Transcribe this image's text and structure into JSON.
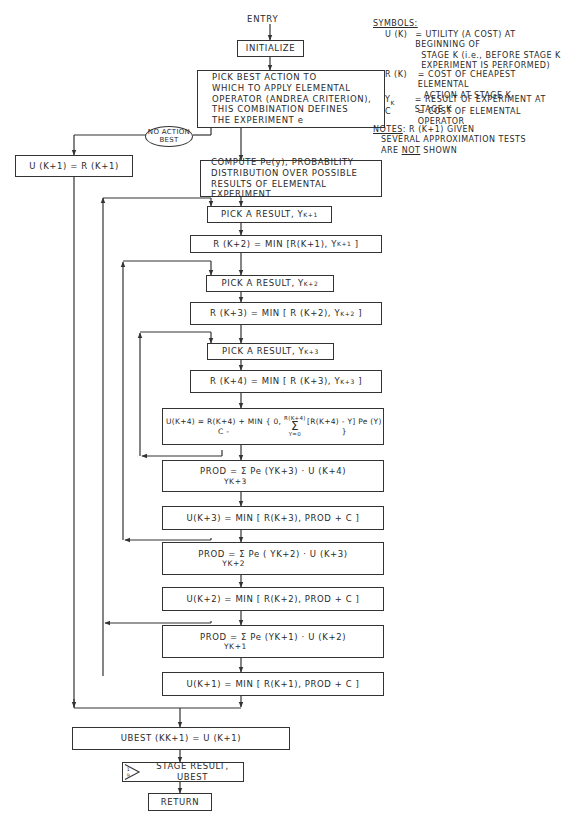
{
  "entry_label": "ENTRY",
  "boxes": {
    "initialize": "INITIALIZE",
    "pick_best": [
      "PICK BEST ACTION TO",
      "WHICH TO APPLY ELEMENTAL",
      "OPERATOR (ANDREA CRITERION),",
      "THIS COMBINATION DEFINES",
      "THE EXPERIMENT  e"
    ],
    "no_action": [
      "NO ACTION",
      "BEST"
    ],
    "u_k1_equals_r": "U (K+1) = R (K+1)",
    "compute_pe": [
      "COMPUTE Pe(y), PROBABILITY",
      "DISTRIBUTION OVER POSSIBLE",
      "RESULTS OF ELEMENTAL",
      "EXPERIMENT"
    ],
    "pick_result_1": "PICK A RESULT, Y",
    "pick_result_1_sub": "K+1",
    "r_k2": "R (K+2) = MIN [R(K+1), Y",
    "r_k2_sub": "K+1",
    "pick_result_2": "PICK A RESULT, Y",
    "pick_result_2_sub": "K+2",
    "r_k3": "R (K+3) = MIN [ R (K+2), Y",
    "r_k3_sub": "K+2",
    "pick_result_3": "PICK A RESULT, Y",
    "pick_result_3_sub": "K+3",
    "r_k4": "R (K+4) = MIN [ R (K+3), Y",
    "r_k4_sub": "K+3",
    "u_k4_left": "U(K+4) = R(K+4) + MIN { 0, C -",
    "u_k4_sum_top": "R(K+4)",
    "u_k4_sum_bottom": "Y=0",
    "u_k4_right": "[R(K+4) - Y] Pe (Y) }",
    "prod_3": "PROD = Σ Pe (Y",
    "prod_3_tail": "K+3) · U (K+4)",
    "prod_3_under": "YK+3",
    "u_k3": "U(K+3) = MIN [ R(K+3),  PROD + C ]",
    "prod_2": "PROD = Σ Pe ( Y",
    "prod_2_tail": "K+2) · U (K+3)",
    "prod_2_under": "YK+2",
    "u_k2": "U(K+2) = MIN [ R(K+2), PROD + C ]",
    "prod_1": "PROD = Σ Pe (Y",
    "prod_1_tail": "K+1) · U (K+2)",
    "prod_1_under": "YK+1",
    "u_k1": "U(K+1) = MIN [ R(K+1),  PROD + C ]",
    "ubest": "UBEST (KK+1) = U (K+1)",
    "stage_result": "STAGE RESULT, UBEST",
    "stage_result_icon": "1/9",
    "return": "RETURN"
  },
  "symbols": {
    "heading": "SYMBOLS:",
    "entries": [
      {
        "sym": "U (K)",
        "def": [
          "= UTILITY (A COST) AT BEGINNING OF",
          "STAGE K (i.e., BEFORE STAGE K",
          "EXPERIMENT IS PERFORMED)"
        ]
      },
      {
        "sym": "R (K)",
        "def": [
          "= COST OF CHEAPEST ELEMENTAL",
          "ACTION AT STAGE K"
        ]
      },
      {
        "sym": "YK",
        "def": [
          "= RESULT OF EXPERIMENT AT STAGE K"
        ]
      },
      {
        "sym": "C",
        "def": [
          "=  COST OF ELEMENTAL OPERATOR"
        ]
      }
    ]
  },
  "notes": {
    "heading": "NOTES",
    "line1": ": R (K+1) GIVEN",
    "line2": "SEVERAL APPROXIMATION TESTS",
    "line3_pre": "ARE ",
    "line3_not": "NOT",
    "line3_post": " SHOWN"
  }
}
